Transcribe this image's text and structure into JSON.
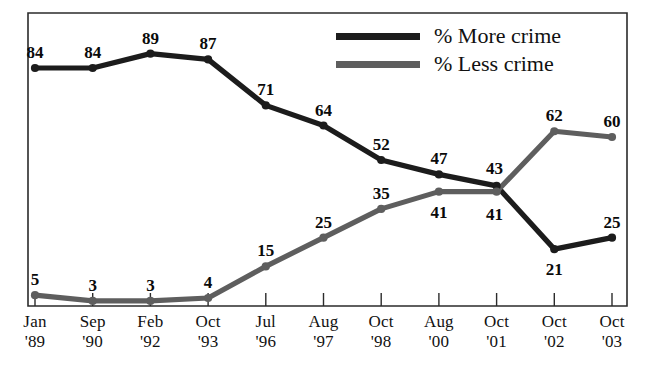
{
  "chart_data": {
    "type": "line",
    "title": "",
    "subtitle": "",
    "xlabel": "",
    "ylabel": "",
    "ylim": [
      0,
      100
    ],
    "grid": false,
    "legend_position": "top-right",
    "categories": [
      {
        "month": "Jan",
        "year": "'89"
      },
      {
        "month": "Sep",
        "year": "'90"
      },
      {
        "month": "Feb",
        "year": "'92"
      },
      {
        "month": "Oct",
        "year": "'93"
      },
      {
        "month": "Jul",
        "year": "'96"
      },
      {
        "month": "Aug",
        "year": "'97"
      },
      {
        "month": "Oct",
        "year": "'98"
      },
      {
        "month": "Aug",
        "year": "'00"
      },
      {
        "month": "Oct",
        "year": "'01"
      },
      {
        "month": "Oct",
        "year": "'02"
      },
      {
        "month": "Oct",
        "year": "'03"
      }
    ],
    "series": [
      {
        "name": "% More crime",
        "color": "#1c1c1c",
        "values": [
          84,
          84,
          89,
          87,
          71,
          64,
          52,
          47,
          43,
          21,
          25
        ],
        "label_offsets": [
          {
            "dx": 0,
            "dy": -24
          },
          {
            "dx": 0,
            "dy": -24
          },
          {
            "dx": 0,
            "dy": -24
          },
          {
            "dx": 0,
            "dy": -24
          },
          {
            "dx": 0,
            "dy": -24
          },
          {
            "dx": 0,
            "dy": -24
          },
          {
            "dx": 0,
            "dy": -24
          },
          {
            "dx": 0,
            "dy": -24
          },
          {
            "dx": -2,
            "dy": -26
          },
          {
            "dx": 0,
            "dy": 12
          },
          {
            "dx": 0,
            "dy": -24
          }
        ]
      },
      {
        "name": "% Less crime",
        "color": "#5e5e5e",
        "values": [
          5,
          3,
          3,
          4,
          15,
          25,
          35,
          41,
          41,
          62,
          60
        ],
        "label_offsets": [
          {
            "dx": 0,
            "dy": -24
          },
          {
            "dx": 0,
            "dy": -24
          },
          {
            "dx": 0,
            "dy": -24
          },
          {
            "dx": 0,
            "dy": -24
          },
          {
            "dx": 0,
            "dy": -24
          },
          {
            "dx": 0,
            "dy": -24
          },
          {
            "dx": 0,
            "dy": -24
          },
          {
            "dx": 0,
            "dy": 12
          },
          {
            "dx": -2,
            "dy": 14
          },
          {
            "dx": 0,
            "dy": -24
          },
          {
            "dx": 0,
            "dy": -24
          }
        ]
      }
    ]
  },
  "legend": {
    "items": [
      {
        "label": "% More crime",
        "color": "#1c1c1c"
      },
      {
        "label": "% Less crime",
        "color": "#5e5e5e"
      }
    ]
  },
  "axes": {
    "frame_color": "#2b2b2b"
  }
}
